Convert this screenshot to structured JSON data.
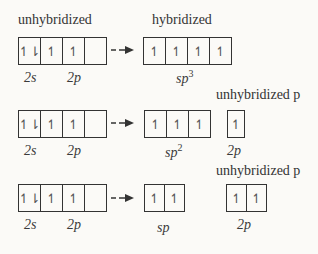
{
  "header": {
    "left_title": "unhybridized",
    "right_title": "hybridized"
  },
  "rows": [
    {
      "ground": {
        "cells": [
          "↿⇂",
          "↿",
          "↿",
          ""
        ],
        "labels": {
          "s": "2s",
          "p": "2p"
        }
      },
      "hybrid": {
        "cells": [
          "↿",
          "↿",
          "↿",
          "↿"
        ],
        "label_base": "sp",
        "label_sup": "3"
      },
      "unhybrid": null
    },
    {
      "ground": {
        "cells": [
          "↿⇂",
          "↿",
          "↿",
          ""
        ],
        "labels": {
          "s": "2s",
          "p": "2p"
        }
      },
      "hybrid": {
        "cells": [
          "↿",
          "↿",
          "↿"
        ],
        "label_base": "sp",
        "label_sup": "2"
      },
      "unhybrid": {
        "title": "unhybridized p",
        "cells": [
          "↿"
        ],
        "label": "2p"
      }
    },
    {
      "ground": {
        "cells": [
          "↿⇂",
          "↿",
          "↿",
          ""
        ],
        "labels": {
          "s": "2s",
          "p": "2p"
        }
      },
      "hybrid": {
        "cells": [
          "↿",
          "↿"
        ],
        "label_base": "sp",
        "label_sup": ""
      },
      "unhybrid": {
        "title": "unhybridized p",
        "cells": [
          "↿",
          "↿"
        ],
        "label": "2p"
      }
    }
  ]
}
